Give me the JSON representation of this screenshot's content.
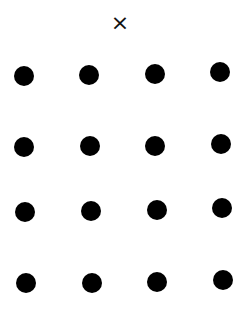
{
  "marker": {
    "symbol": "×",
    "icon": "x-mark-icon",
    "position": {
      "x": 119,
      "y": 24
    }
  },
  "grid": {
    "rows": 4,
    "columns": 4,
    "dot_color": "#000000",
    "dot_diameter": 20,
    "dots": [
      {
        "row": 1,
        "col": 1,
        "x": 24,
        "y": 76
      },
      {
        "row": 1,
        "col": 2,
        "x": 89,
        "y": 75
      },
      {
        "row": 1,
        "col": 3,
        "x": 155,
        "y": 74
      },
      {
        "row": 1,
        "col": 4,
        "x": 220,
        "y": 72
      },
      {
        "row": 2,
        "col": 1,
        "x": 24,
        "y": 147
      },
      {
        "row": 2,
        "col": 2,
        "x": 90,
        "y": 146
      },
      {
        "row": 2,
        "col": 3,
        "x": 155,
        "y": 146
      },
      {
        "row": 2,
        "col": 4,
        "x": 221,
        "y": 144
      },
      {
        "row": 3,
        "col": 1,
        "x": 25,
        "y": 212
      },
      {
        "row": 3,
        "col": 2,
        "x": 91,
        "y": 211
      },
      {
        "row": 3,
        "col": 3,
        "x": 157,
        "y": 210
      },
      {
        "row": 3,
        "col": 4,
        "x": 222,
        "y": 208
      },
      {
        "row": 4,
        "col": 1,
        "x": 26,
        "y": 283
      },
      {
        "row": 4,
        "col": 2,
        "x": 92,
        "y": 283
      },
      {
        "row": 4,
        "col": 3,
        "x": 157,
        "y": 282
      },
      {
        "row": 4,
        "col": 4,
        "x": 223,
        "y": 280
      }
    ]
  }
}
